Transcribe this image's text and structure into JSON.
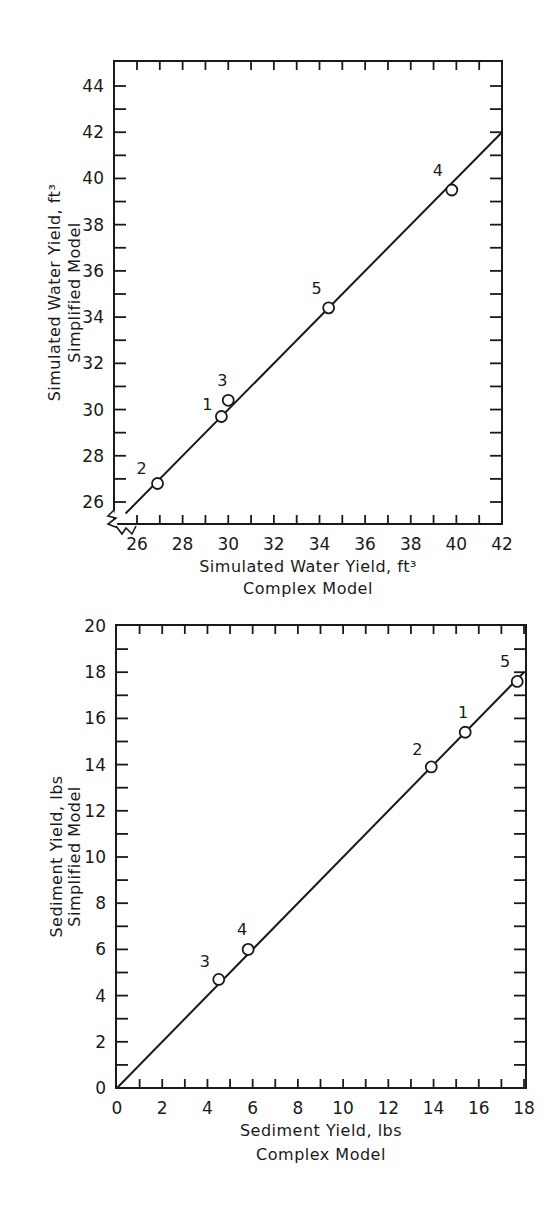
{
  "chart_data": [
    {
      "type": "scatter",
      "title": "",
      "xlabel": "Simulated Water Yield, ft³",
      "xlabel_sub": "Complex Model",
      "ylabel": "Simulated Water Yield, ft³",
      "ylabel_sub": "Simplified Model",
      "xlim": [
        25.5,
        42
      ],
      "ylim": [
        25,
        45
      ],
      "x_ticks": [
        26,
        28,
        30,
        32,
        34,
        36,
        38,
        40,
        42
      ],
      "y_ticks": [
        26,
        28,
        30,
        32,
        34,
        36,
        38,
        40,
        42,
        44
      ],
      "axis_break": true,
      "grid": false,
      "points": [
        {
          "label": "1",
          "x": 29.7,
          "y": 29.7
        },
        {
          "label": "2",
          "x": 26.9,
          "y": 26.8
        },
        {
          "label": "3",
          "x": 30.0,
          "y": 30.4
        },
        {
          "label": "4",
          "x": 39.8,
          "y": 39.5
        },
        {
          "label": "5",
          "x": 34.4,
          "y": 34.4
        }
      ],
      "line": {
        "description": "1:1 line",
        "x": [
          25.5,
          42
        ],
        "y": [
          25.5,
          42
        ]
      }
    },
    {
      "type": "scatter",
      "title": "",
      "xlabel": "Sediment Yield, lbs",
      "xlabel_sub": "Complex Model",
      "ylabel": "Sediment Yield, lbs",
      "ylabel_sub": "Simplified Model",
      "xlim": [
        0,
        18
      ],
      "ylim": [
        0,
        20
      ],
      "x_ticks": [
        0,
        2,
        4,
        6,
        8,
        10,
        12,
        14,
        16,
        18
      ],
      "y_ticks": [
        0,
        2,
        4,
        6,
        8,
        10,
        12,
        14,
        16,
        18,
        20
      ],
      "grid": false,
      "points": [
        {
          "label": "1",
          "x": 15.4,
          "y": 15.4
        },
        {
          "label": "2",
          "x": 13.9,
          "y": 13.9
        },
        {
          "label": "3",
          "x": 4.5,
          "y": 4.7
        },
        {
          "label": "4",
          "x": 5.8,
          "y": 6.0
        },
        {
          "label": "5",
          "x": 17.7,
          "y": 17.6
        }
      ],
      "line": {
        "description": "1:1 line",
        "x": [
          0,
          18
        ],
        "y": [
          0,
          18
        ]
      }
    }
  ]
}
